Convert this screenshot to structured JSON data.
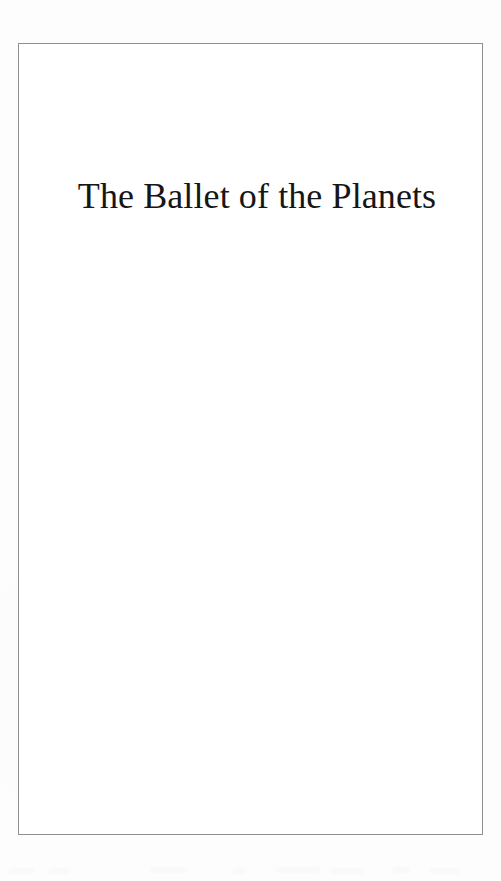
{
  "document": {
    "kind": "scanned-book-page",
    "page_type": "half-title-page",
    "background_color": "#fdfdfd",
    "sheet_color": "#ffffff"
  },
  "frame": {
    "name": "printed-rule-border",
    "color": "#8d8f92",
    "thickness": "1px",
    "left": 18,
    "top": 43,
    "width": 465,
    "height": 792
  },
  "title_block": {
    "title": "The Ballet of the Planets",
    "title_color": "#161616",
    "title_font_size": "36px",
    "alignment": "center"
  },
  "artifacts": {
    "label": "scanner-edge-smudges",
    "visible": true
  }
}
